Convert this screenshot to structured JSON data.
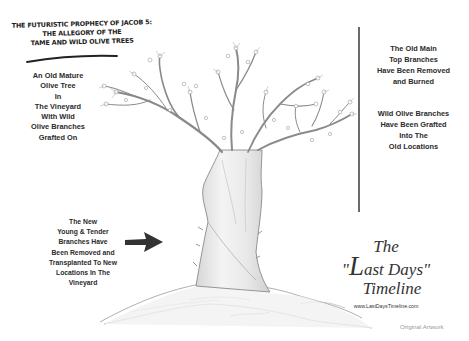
{
  "title": {
    "lines": [
      "The Futuristic Prophecy of Jacob 5:",
      "The Allegory of the",
      "Tame and Wild Olive Trees"
    ]
  },
  "captions": {
    "left_top": {
      "lines": [
        "An Old Mature",
        "Olive Tree",
        "In",
        "The Vineyard",
        "With Wild",
        "Olive Branches",
        "Grafted On"
      ]
    },
    "right_top": {
      "lines": [
        "The Old Main",
        "Top Branches",
        "Have Been Removed",
        "and Burned"
      ]
    },
    "right_mid": {
      "lines": [
        "Wild Olive Branches",
        "Have Been Grafted",
        "Into The",
        "Old Locations"
      ]
    },
    "bottom_left": {
      "lines": [
        "The New",
        "Young & Tender",
        "Branches Have",
        "Been Removed and",
        "Transplanted To New",
        "Locations In The",
        "Vineyard"
      ]
    }
  },
  "brand": {
    "the": "The",
    "quote_open": "\"",
    "big_letter": "L",
    "rest": "ast Days",
    "quote_close": "\"",
    "timeline": "Timeline",
    "url": "www.LastDaysTimeline.com"
  },
  "credit": "Original Artwork",
  "colors": {
    "ink": "#2a2a2a",
    "pencil": "#8c8c8c",
    "divider": "#6a6a6a",
    "arrow": "#333333",
    "credit": "#9a9a9a"
  },
  "icons": {
    "arrow": "right-arrow-icon"
  }
}
